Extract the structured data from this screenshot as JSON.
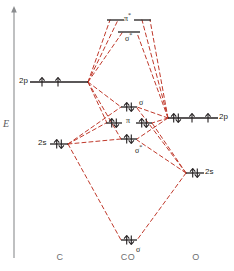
{
  "figure": {
    "kind": "molecular-orbital-energy-diagram",
    "molecule": "CO",
    "line_color": "#c0392b",
    "level_color": "#231f20",
    "axis_color": "#8a8c8e",
    "label_color": "#6d6e70"
  },
  "axis": {
    "label": "E",
    "name": "energy-axis"
  },
  "columns": [
    {
      "key": "left",
      "label": "C",
      "x": 60
    },
    {
      "key": "center",
      "label": "CO",
      "x": 128
    },
    {
      "key": "right",
      "label": "O",
      "x": 196
    }
  ],
  "atomic_orbitals": {
    "carbon": [
      {
        "key": "c-2p",
        "label": "2p",
        "label_side": "left",
        "y": 82,
        "x_start": 30,
        "x_end": 88,
        "electrons": [
          "up",
          "up",
          "none"
        ],
        "electron_x": [
          42,
          58,
          76
        ]
      },
      {
        "key": "c-2s",
        "label": "2s",
        "label_side": "left",
        "y": 144,
        "x_start": 50,
        "x_end": 68,
        "electrons": [
          "pair"
        ],
        "electron_x": [
          59
        ]
      }
    ],
    "oxygen": [
      {
        "key": "o-2p",
        "label": "2p",
        "label_side": "right",
        "y": 118,
        "x_start": 168,
        "x_end": 218,
        "electrons": [
          "pair",
          "up",
          "up"
        ],
        "electron_x": [
          176,
          192,
          208
        ]
      },
      {
        "key": "o-2s",
        "label": "2s",
        "label_side": "right",
        "y": 173,
        "x_start": 186,
        "x_end": 204,
        "electrons": [
          "pair"
        ],
        "electron_x": [
          195
        ]
      }
    ]
  },
  "molecular_orbitals": [
    {
      "key": "mo-pi-star",
      "label": "π",
      "star": true,
      "label_text": "π*",
      "label_pos": "center-above",
      "y": 20,
      "segments": [
        {
          "x_start": 107,
          "x_end": 124
        },
        {
          "x_start": 134,
          "x_end": 151
        }
      ],
      "electrons": []
    },
    {
      "key": "mo-sigma-star-upper",
      "label": "σ",
      "star": true,
      "label_text": "σ*",
      "label_pos": "center-below",
      "y": 32,
      "segments": [
        {
          "x_start": 118,
          "x_end": 140
        }
      ],
      "electrons": []
    },
    {
      "key": "mo-sigma-nonbonding",
      "label": "σ",
      "star": false,
      "label_text": "σ",
      "label_pos": "right-above",
      "y": 107,
      "segments": [
        {
          "x_start": 121,
          "x_end": 137
        }
      ],
      "electrons": [
        "pair"
      ],
      "electron_x": [
        129
      ]
    },
    {
      "key": "mo-pi-bonding",
      "label": "π",
      "star": false,
      "label_text": "π",
      "label_pos": "center-between",
      "y": 123,
      "segments": [
        {
          "x_start": 106,
          "x_end": 122
        },
        {
          "x_start": 136,
          "x_end": 152
        }
      ],
      "electrons": [
        "pair",
        "pair"
      ],
      "electron_x": [
        114,
        144
      ]
    },
    {
      "key": "mo-sigma-star-lower",
      "label": "σ",
      "star": true,
      "label_text": "σ*",
      "label_pos": "right-below",
      "y": 139,
      "segments": [
        {
          "x_start": 121,
          "x_end": 137
        }
      ],
      "electrons": [
        "pair"
      ],
      "electron_x": [
        129
      ]
    },
    {
      "key": "mo-sigma-bonding",
      "label": "σ",
      "star": false,
      "label_text": "σ",
      "label_pos": "right-below",
      "y": 240,
      "segments": [
        {
          "x_start": 121,
          "x_end": 137
        }
      ],
      "electrons": [
        "pair"
      ],
      "electron_x": [
        129
      ]
    }
  ],
  "correlation_lines": [
    {
      "from": "c-2p",
      "to": "mo-pi-star",
      "x1": 88,
      "y1": 82,
      "x2": 110,
      "y2": 20
    },
    {
      "from": "c-2p",
      "to": "mo-pi-star-b",
      "x1": 88,
      "y1": 82,
      "x2": 118,
      "y2": 20
    },
    {
      "from": "c-2p",
      "to": "mo-sigma-star-upper",
      "x1": 88,
      "y1": 82,
      "x2": 122,
      "y2": 33
    },
    {
      "from": "c-2p",
      "to": "mo-sigma-nb",
      "x1": 88,
      "y1": 82,
      "x2": 121,
      "y2": 107
    },
    {
      "from": "c-2p",
      "to": "mo-pi-bonding-l",
      "x1": 88,
      "y1": 82,
      "x2": 107,
      "y2": 123
    },
    {
      "from": "c-2p",
      "to": "mo-sigma-star-lower",
      "x1": 88,
      "y1": 82,
      "x2": 121,
      "y2": 139
    },
    {
      "from": "o-2p",
      "to": "mo-pi-star",
      "x1": 168,
      "y1": 118,
      "x2": 150,
      "y2": 20
    },
    {
      "from": "o-2p",
      "to": "mo-pi-star-b",
      "x1": 168,
      "y1": 118,
      "x2": 142,
      "y2": 20
    },
    {
      "from": "o-2p",
      "to": "mo-sigma-star-upper",
      "x1": 168,
      "y1": 118,
      "x2": 137,
      "y2": 33
    },
    {
      "from": "o-2p",
      "to": "mo-sigma-nb",
      "x1": 168,
      "y1": 118,
      "x2": 137,
      "y2": 107
    },
    {
      "from": "o-2p",
      "to": "mo-pi-bonding-r",
      "x1": 168,
      "y1": 118,
      "x2": 152,
      "y2": 123
    },
    {
      "from": "o-2p",
      "to": "mo-sigma-star-lower",
      "x1": 168,
      "y1": 118,
      "x2": 137,
      "y2": 139
    },
    {
      "from": "c-2s",
      "to": "mo-sigma-nb",
      "x1": 68,
      "y1": 144,
      "x2": 121,
      "y2": 107
    },
    {
      "from": "c-2s",
      "to": "mo-pi-bonding-l",
      "x1": 68,
      "y1": 144,
      "x2": 106,
      "y2": 123
    },
    {
      "from": "c-2s",
      "to": "mo-sigma-star-lower",
      "x1": 68,
      "y1": 144,
      "x2": 121,
      "y2": 139
    },
    {
      "from": "c-2s",
      "to": "mo-sigma-bonding",
      "x1": 68,
      "y1": 144,
      "x2": 121,
      "y2": 240
    },
    {
      "from": "o-2s",
      "to": "mo-sigma-nb",
      "x1": 186,
      "y1": 173,
      "x2": 137,
      "y2": 108
    },
    {
      "from": "o-2s",
      "to": "mo-pi-bonding-r",
      "x1": 186,
      "y1": 173,
      "x2": 152,
      "y2": 123
    },
    {
      "from": "o-2s",
      "to": "mo-sigma-star-lower",
      "x1": 186,
      "y1": 173,
      "x2": 137,
      "y2": 140
    },
    {
      "from": "o-2s",
      "to": "mo-sigma-bonding",
      "x1": 186,
      "y1": 173,
      "x2": 137,
      "y2": 240
    }
  ]
}
